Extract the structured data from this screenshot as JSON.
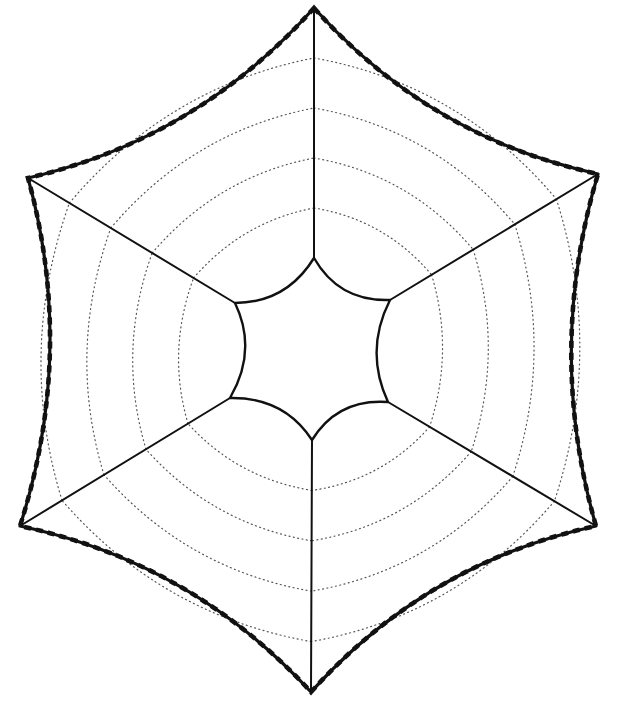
{
  "diagram": {
    "title": "",
    "colors": {
      "background": "#ffffff",
      "line": "#111111",
      "dotted": "#555555"
    },
    "outer_vertices": [
      {
        "name": "top",
        "x": 314,
        "y": 8
      },
      {
        "name": "upper-right",
        "x": 598,
        "y": 174
      },
      {
        "name": "lower-right",
        "x": 596,
        "y": 526
      },
      {
        "name": "bottom",
        "x": 311,
        "y": 692
      },
      {
        "name": "lower-left",
        "x": 20,
        "y": 526
      },
      {
        "name": "upper-left",
        "x": 28,
        "y": 178
      }
    ],
    "inner_vertices": [
      {
        "name": "top",
        "x": 314,
        "y": 258
      },
      {
        "name": "upper-right",
        "x": 390,
        "y": 300
      },
      {
        "name": "lower-right",
        "x": 388,
        "y": 402
      },
      {
        "name": "bottom",
        "x": 312,
        "y": 440
      },
      {
        "name": "lower-left",
        "x": 230,
        "y": 398
      },
      {
        "name": "upper-left",
        "x": 235,
        "y": 303
      }
    ],
    "spoke_count": 6,
    "dotted_rings_per_sector": 4,
    "outer_edge_style": "thick-dashed-concave",
    "inner_edge_style": "solid-concave",
    "outer_concavity": 0.09,
    "inner_concavity": 0.16,
    "ring_bow": 0.1
  }
}
